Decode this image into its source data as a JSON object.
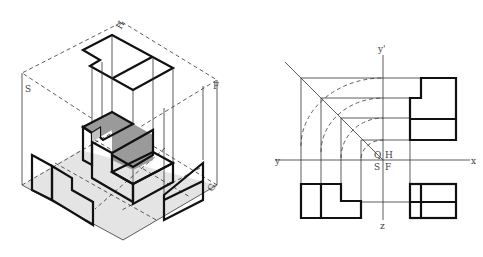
{
  "figure": {
    "left_panel": {
      "title": "Isometric projection box with three projection planes",
      "plane_labels": {
        "top": "H",
        "left": "S",
        "right": "F",
        "bottom_right": "G"
      },
      "fill_colors": {
        "light": "#d6d6d6",
        "medium": "#b4b4b4",
        "dark": "#7a7a7a",
        "darkest": "#5a5a5a"
      }
    },
    "right_panel": {
      "title": "Orthographic projections with folding axes",
      "axis_labels": {
        "y_left": "y",
        "x_right": "x",
        "y_prime_top": "y'",
        "z_bottom": "z"
      },
      "quadrant_labels": {
        "top_left": "Q",
        "top_right": "H",
        "bottom_left": "S",
        "bottom_right": "F"
      }
    }
  }
}
